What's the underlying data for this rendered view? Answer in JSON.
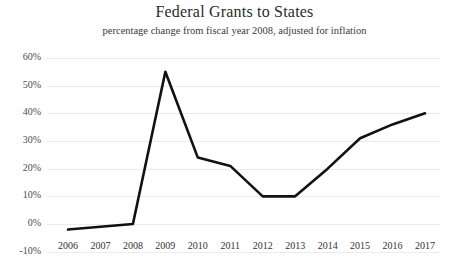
{
  "chart_data": {
    "type": "line",
    "title": "Federal Grants to States",
    "subtitle": "percentage change from fiscal year 2008, adjusted for inflation",
    "xlabel": "",
    "ylabel": "",
    "grid": true,
    "legend": "none",
    "categories": [
      "2006",
      "2007",
      "2008",
      "2009",
      "2010",
      "2011",
      "2012",
      "2013",
      "2014",
      "2015",
      "2016",
      "2017"
    ],
    "x": [
      2006,
      2007,
      2008,
      2009,
      2010,
      2011,
      2012,
      2013,
      2014,
      2015,
      2016,
      2017
    ],
    "values": [
      -2,
      -1,
      0,
      55,
      24,
      21,
      10,
      10,
      20,
      31,
      36,
      40
    ],
    "series": [
      {
        "name": "percentage change from fiscal year 2008",
        "values": [
          -2,
          -1,
          0,
          55,
          24,
          21,
          10,
          10,
          20,
          31,
          36,
          40
        ]
      }
    ],
    "ylim": [
      -10,
      60
    ],
    "xlim": [
      2006,
      2017
    ],
    "ytick_labels": [
      "60%",
      "50%",
      "40%",
      "30%",
      "20%",
      "10%",
      "0%",
      "-10%"
    ],
    "ytick_values": [
      60,
      50,
      40,
      30,
      20,
      10,
      0,
      -10
    ],
    "line_color": "#111111",
    "grid_color": "#ececec",
    "background_color": "#ffffff"
  }
}
